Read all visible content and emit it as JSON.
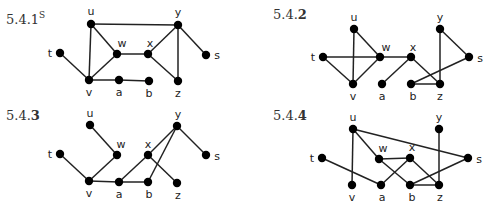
{
  "graphs": [
    {
      "id": "5.4.1",
      "label_main": "5.4.1",
      "label_sup": "S",
      "label_pos": [
        6,
        20
      ],
      "nodes": {
        "u": {
          "x": 91,
          "y": 24,
          "lx": 91,
          "ly": 11
        },
        "t": {
          "x": 60,
          "y": 53,
          "lx": 50,
          "ly": 53
        },
        "w": {
          "x": 117,
          "y": 54,
          "lx": 122,
          "ly": 43
        },
        "v": {
          "x": 89,
          "y": 80,
          "lx": 89,
          "ly": 92
        },
        "a": {
          "x": 119,
          "y": 80,
          "lx": 119,
          "ly": 92
        },
        "x": {
          "x": 148,
          "y": 54,
          "lx": 150,
          "ly": 43
        },
        "y": {
          "x": 178,
          "y": 25,
          "lx": 178,
          "ly": 12
        },
        "s": {
          "x": 206,
          "y": 55,
          "lx": 217,
          "ly": 55
        },
        "b": {
          "x": 149,
          "y": 81,
          "lx": 149,
          "ly": 93
        },
        "z": {
          "x": 178,
          "y": 81,
          "lx": 178,
          "ly": 93
        }
      },
      "edges": [
        [
          "u",
          "y"
        ],
        [
          "u",
          "v"
        ],
        [
          "u",
          "w"
        ],
        [
          "t",
          "v"
        ],
        [
          "v",
          "w"
        ],
        [
          "v",
          "a"
        ],
        [
          "a",
          "b"
        ],
        [
          "w",
          "x"
        ],
        [
          "x",
          "y"
        ],
        [
          "x",
          "z"
        ],
        [
          "y",
          "z"
        ],
        [
          "y",
          "s"
        ]
      ]
    },
    {
      "id": "5.4.2",
      "label_main": "5.4.",
      "label_bold": "2",
      "label_pos": [
        273,
        16
      ],
      "nodes": {
        "u": {
          "x": 354,
          "y": 29,
          "lx": 354,
          "ly": 17
        },
        "t": {
          "x": 323,
          "y": 57,
          "lx": 313,
          "ly": 57
        },
        "w": {
          "x": 380,
          "y": 57,
          "lx": 386,
          "ly": 47
        },
        "v": {
          "x": 353,
          "y": 84,
          "lx": 353,
          "ly": 96
        },
        "a": {
          "x": 382,
          "y": 84,
          "lx": 382,
          "ly": 96
        },
        "x": {
          "x": 411,
          "y": 57,
          "lx": 413,
          "ly": 47
        },
        "y": {
          "x": 440,
          "y": 29,
          "lx": 440,
          "ly": 17
        },
        "s": {
          "x": 469,
          "y": 57,
          "lx": 480,
          "ly": 58
        },
        "b": {
          "x": 411,
          "y": 84,
          "lx": 413,
          "ly": 96
        },
        "z": {
          "x": 440,
          "y": 84,
          "lx": 440,
          "ly": 96
        }
      },
      "edges": [
        [
          "u",
          "v"
        ],
        [
          "u",
          "w"
        ],
        [
          "t",
          "w"
        ],
        [
          "t",
          "v"
        ],
        [
          "v",
          "w"
        ],
        [
          "w",
          "x"
        ],
        [
          "x",
          "a"
        ],
        [
          "x",
          "z"
        ],
        [
          "y",
          "z"
        ],
        [
          "y",
          "s"
        ],
        [
          "s",
          "b"
        ],
        [
          "b",
          "z"
        ]
      ]
    },
    {
      "id": "5.4.3",
      "label_main": "5.4.",
      "label_bold": "3",
      "label_pos": [
        6,
        117
      ],
      "nodes": {
        "u": {
          "x": 90,
          "y": 125,
          "lx": 90,
          "ly": 113
        },
        "t": {
          "x": 60,
          "y": 154,
          "lx": 50,
          "ly": 154
        },
        "w": {
          "x": 117,
          "y": 155,
          "lx": 121,
          "ly": 144
        },
        "v": {
          "x": 89,
          "y": 181,
          "lx": 89,
          "ly": 193
        },
        "a": {
          "x": 119,
          "y": 182,
          "lx": 119,
          "ly": 194
        },
        "x": {
          "x": 148,
          "y": 155,
          "lx": 148,
          "ly": 144
        },
        "y": {
          "x": 177,
          "y": 126,
          "lx": 178,
          "ly": 114
        },
        "s": {
          "x": 206,
          "y": 155,
          "lx": 217,
          "ly": 156
        },
        "b": {
          "x": 148,
          "y": 182,
          "lx": 149,
          "ly": 194
        },
        "z": {
          "x": 177,
          "y": 183,
          "lx": 178,
          "ly": 195
        }
      },
      "edges": [
        [
          "u",
          "w"
        ],
        [
          "w",
          "v"
        ],
        [
          "t",
          "v"
        ],
        [
          "v",
          "a"
        ],
        [
          "a",
          "b"
        ],
        [
          "a",
          "x"
        ],
        [
          "x",
          "y"
        ],
        [
          "x",
          "z"
        ],
        [
          "y",
          "b"
        ],
        [
          "y",
          "s"
        ]
      ]
    },
    {
      "id": "5.4.4",
      "label_main": "5.4.",
      "label_bold": "4",
      "label_pos": [
        273,
        117
      ],
      "nodes": {
        "u": {
          "x": 353,
          "y": 129,
          "lx": 353,
          "ly": 117
        },
        "t": {
          "x": 322,
          "y": 158,
          "lx": 312,
          "ly": 158
        },
        "w": {
          "x": 379,
          "y": 159,
          "lx": 383,
          "ly": 148
        },
        "v": {
          "x": 352,
          "y": 185,
          "lx": 352,
          "ly": 197
        },
        "a": {
          "x": 381,
          "y": 185,
          "lx": 382,
          "ly": 197
        },
        "x": {
          "x": 410,
          "y": 158,
          "lx": 412,
          "ly": 147
        },
        "y": {
          "x": 439,
          "y": 129,
          "lx": 439,
          "ly": 117
        },
        "s": {
          "x": 468,
          "y": 158,
          "lx": 479,
          "ly": 159
        },
        "b": {
          "x": 410,
          "y": 185,
          "lx": 412,
          "ly": 197
        },
        "z": {
          "x": 439,
          "y": 185,
          "lx": 440,
          "ly": 197
        }
      },
      "edges": [
        [
          "u",
          "v"
        ],
        [
          "u",
          "w"
        ],
        [
          "u",
          "s"
        ],
        [
          "t",
          "a"
        ],
        [
          "w",
          "x"
        ],
        [
          "w",
          "b"
        ],
        [
          "a",
          "x"
        ],
        [
          "x",
          "z"
        ],
        [
          "b",
          "z"
        ],
        [
          "b",
          "s"
        ],
        [
          "y",
          "z"
        ]
      ]
    }
  ],
  "style": {
    "node_radius": 4.2,
    "edge_color": "#222222",
    "node_color": "#000000"
  }
}
